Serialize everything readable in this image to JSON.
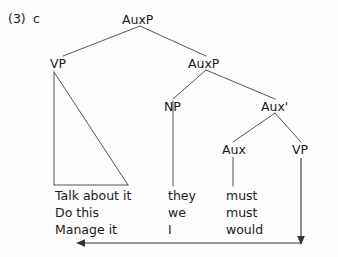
{
  "figure": {
    "example_number": "(3)",
    "example_letter": "c",
    "type": "syntax-tree"
  },
  "nodes": {
    "auxp_top": "AuxP",
    "vp_left": "VP",
    "auxp_lower": "AuxP",
    "np": "NP",
    "aux_bar": "Aux'",
    "aux": "Aux",
    "vp_right": "VP"
  },
  "word_rows": [
    {
      "vp": "Talk about it",
      "np": "they",
      "aux": "must"
    },
    {
      "vp": "Do this",
      "np": "we",
      "aux": "must"
    },
    {
      "vp": "Manage it",
      "np": "I",
      "aux": "would"
    }
  ],
  "movement_arrow": {
    "name": "movement-arrow",
    "from": "vp_right",
    "to": "vp_left",
    "direction": "right-to-left",
    "double_headed": true
  },
  "colors": {
    "ink": "#1a1a1a",
    "line": "#555555",
    "background": "#fdfdfd"
  }
}
